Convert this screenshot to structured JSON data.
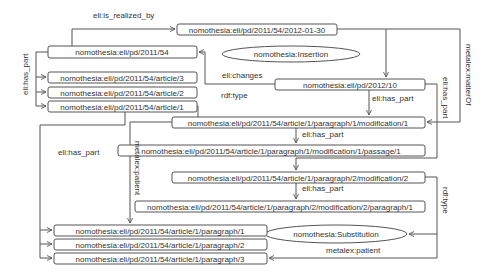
{
  "diagram": {
    "nodes": {
      "expr_2012": "nomothesia:eli/pd/2011/54/2012-01-30",
      "work_2011_54": "nomothesia:eli/pd/2011/54",
      "insertion": "nomothesia:Insertion",
      "article3": "nomothesia:eli/pd/2011/54/article/3",
      "article2": "nomothesia:eli/pd/2011/54/article/2",
      "article1": "nomothesia:eli/pd/2011/54/article/1",
      "work_2012_10": "nomothesia:eli/pd/2012/10",
      "mod1": "nomothesia:eli/pd/2011/54/article/1/paragraph/1/modification/1",
      "passage1": "nomothesia:eli/pd/2011/54/article/1/paragraph/1/modification/1/passage/1",
      "mod2": "nomothesia:eli/pd/2011/54/article/1/paragraph/2/modification/2",
      "mod2para1": "nomothesia:eli/pd/2011/54/article/1/paragraph/2/modification/2/paragraph/1",
      "substitution": "nomothesia:Substitution",
      "paragraph1": "nomothesia:eli/pd/2011/54/article/1/paragraph/1",
      "paragraph2": "nomothesia:eli/pd/2011/54/article/1/paragraph/2",
      "paragraph3": "nomothesia:eli/pd/2011/54/article/1/paragraph/3"
    },
    "edge_labels": {
      "is_realized_by": "eli:is_realized_by",
      "has_part_left": "eli:has_part",
      "changes": "eli:changes",
      "rdf_type_top": "rdf:type",
      "has_part_2012": "eli:has_part",
      "has_part_mod1": "eli:has_part",
      "has_part_article1": "eli:has_part",
      "patient_mod1": "metalex:patient",
      "has_part_mod2": "eli:has_part",
      "has_part_right": "eli:has_part",
      "matter_of": "metalex:matterOf",
      "rdf_type_right": "rdf:type",
      "patient_mod2": "metalex:patient"
    }
  }
}
